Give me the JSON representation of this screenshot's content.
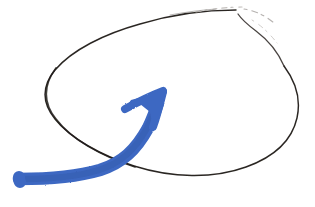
{
  "canvas": {
    "width": 315,
    "height": 207,
    "background_color": "#ffffff",
    "media": "scanned hand drawing"
  },
  "drawing": {
    "title": "Hand-drawn ellipse encircled by an upward blue arrow",
    "elements": [
      {
        "name": "ellipse-outline",
        "kind": "freehand ellipse loop",
        "instrument": "fine black pen",
        "stroke_color": "#2b2724",
        "faded_stroke_color": "#b9b5b2",
        "stroke_width": 1.5,
        "center_x": 170,
        "center_y": 88,
        "radius_x": 128,
        "radius_y": 62,
        "rotation_deg": -14,
        "has_pen_lift_gap": true,
        "gap_location": "top-right"
      },
      {
        "name": "blue-arrow",
        "kind": "curved arrow sweeping up to the right",
        "instrument": "blue marker",
        "color": "#3d68c2",
        "shade_color": "#355bab",
        "stroke_width": 12,
        "tail_x": 18,
        "tail_y": 179,
        "tip_x": 164,
        "tip_y": 92,
        "direction": "up-right"
      }
    ]
  },
  "colors": {
    "ink_black": "#2b2724",
    "ink_faded": "#b9b5b2",
    "marker_blue": "#3d68c2",
    "marker_blue_shade": "#355bab",
    "paper_white": "#ffffff"
  }
}
